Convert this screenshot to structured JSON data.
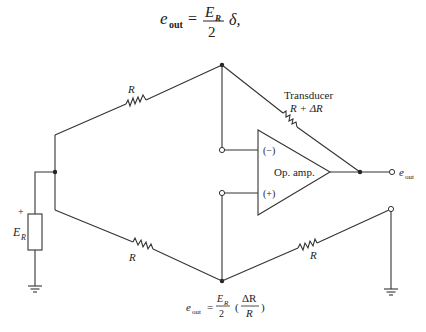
{
  "title_equation": {
    "lhs": "e",
    "lhs_sub": "out",
    "equals": "=",
    "numerator": "E",
    "numerator_sub": "R",
    "denominator": "2",
    "tail": "δ,"
  },
  "labels": {
    "r_top_left": "R",
    "r_bottom_left": "R",
    "r_bottom_right": "R",
    "transducer_title": "Transducer",
    "transducer_value": "R + ΔR",
    "opamp": "Op. amp.",
    "inv_input": "(−)",
    "noninv_input": "(+)",
    "output": "e",
    "output_sub": "out",
    "source_plus": "+",
    "source": "E",
    "source_sub": "R"
  },
  "bottom_equation": {
    "lhs": "e",
    "lhs_sub": "out",
    "equals": "=",
    "numerator": "E",
    "numerator_sub": "R",
    "denominator": "2",
    "paren_open": "(",
    "inner_num": "ΔR",
    "inner_den": "R",
    "paren_close": ")"
  },
  "colors": {
    "line": "#333333",
    "text": "#222222",
    "background": "#ffffff"
  }
}
